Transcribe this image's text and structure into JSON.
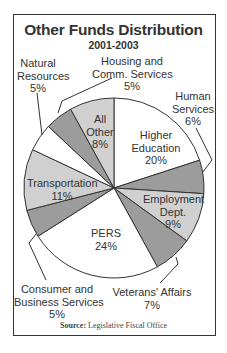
{
  "chart_data": {
    "type": "pie",
    "title": "Other Funds Distribution",
    "subtitle": "2001-2003",
    "source_label": "Source:",
    "source_text": "Legislative Fiscal Office",
    "start_angle_deg": 0,
    "direction": "clockwise",
    "slices": [
      {
        "label": "Higher Education",
        "value": 20,
        "color": "#ffffff"
      },
      {
        "label": "Human Services",
        "value": 6,
        "color": "#9c9c9c"
      },
      {
        "label": "Employment Dept.",
        "value": 9,
        "color": "#d0d0d0"
      },
      {
        "label": "Veterans' Affairs",
        "value": 7,
        "color": "#9c9c9c"
      },
      {
        "label": "PERS",
        "value": 24,
        "color": "#ffffff"
      },
      {
        "label": "Consumer and Business Services",
        "value": 5,
        "color": "#9c9c9c"
      },
      {
        "label": "Transportation",
        "value": 11,
        "color": "#d0d0d0"
      },
      {
        "label": "Natural Resources",
        "value": 5,
        "color": "#ffffff"
      },
      {
        "label": "Housing and Comm. Services",
        "value": 5,
        "color": "#9c9c9c"
      },
      {
        "label": "All Other",
        "value": 8,
        "color": "#d0d0d0"
      }
    ],
    "units": "%"
  },
  "labels": {
    "higher_ed": [
      "Higher",
      "Education",
      "20%"
    ],
    "human_services": [
      "Human",
      "Services",
      "6%"
    ],
    "employment": [
      "Employment",
      "Dept.",
      "9%"
    ],
    "veterans": [
      "Veterans' Affairs",
      "7%"
    ],
    "pers": [
      "PERS",
      "24%"
    ],
    "consumer": [
      "Consumer and",
      "Business Services",
      "5%"
    ],
    "transportation": [
      "Transportation",
      "11%"
    ],
    "natural_resources": [
      "Natural",
      "Resources",
      "5%"
    ],
    "housing": [
      "Housing and",
      "Comm. Services",
      "5%"
    ],
    "all_other": [
      "All",
      "Other",
      "8%"
    ]
  }
}
